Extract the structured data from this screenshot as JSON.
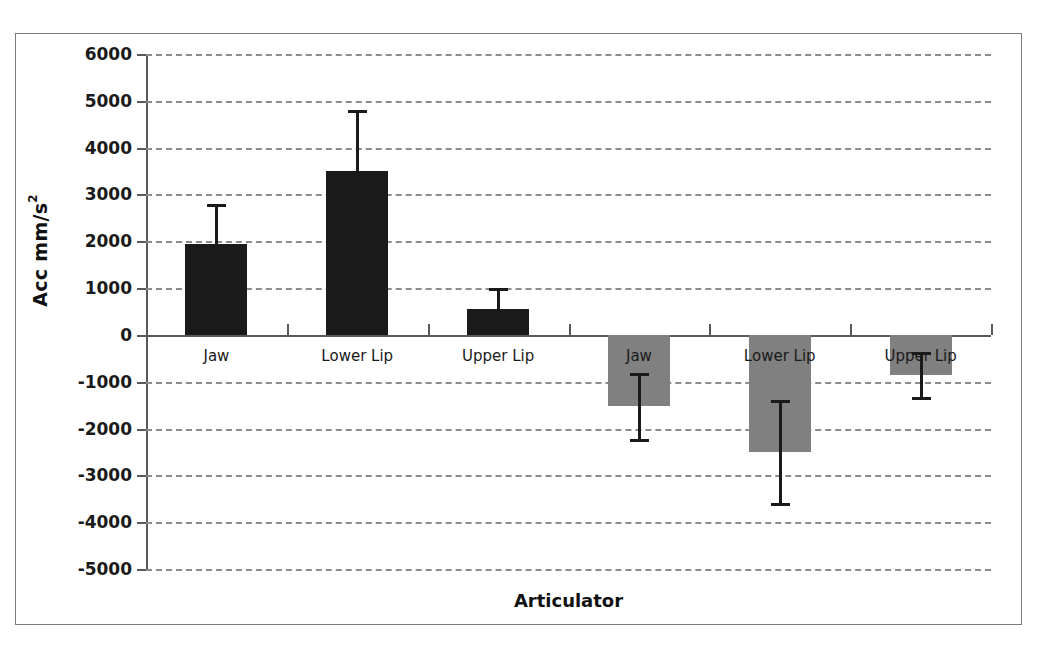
{
  "chart_data": {
    "type": "bar",
    "title": "",
    "subtitle": "",
    "xlabel": "Articulator",
    "ylabel": "Acc mm/s",
    "ylabel_superscript": "2",
    "ylim": [
      -5000,
      6000
    ],
    "ytick_step": 1000,
    "yticks": [
      6000,
      5000,
      4000,
      3000,
      2000,
      1000,
      0,
      -1000,
      -2000,
      -3000,
      -4000,
      -5000
    ],
    "ytick_labels": [
      "6000",
      "5000",
      "4000",
      "3000",
      "2000",
      "1000",
      "0",
      "-1000",
      "-2000",
      "-3000",
      "-4000",
      "-5000"
    ],
    "grid": true,
    "grid_style": "dashed",
    "legend": "none",
    "categories": [
      "Jaw",
      "Lower Lip",
      "Upper Lip",
      "Jaw",
      "Lower Lip",
      "Upper Lip"
    ],
    "bars": [
      {
        "label": "Jaw",
        "value": 1950,
        "error": 850,
        "error_high": 2800,
        "error_low": 1100,
        "color": "#1a1a1a",
        "group": "opening"
      },
      {
        "label": "Lower Lip",
        "value": 3500,
        "error": 1300,
        "error_high": 4800,
        "error_low": 2200,
        "color": "#1a1a1a",
        "group": "opening"
      },
      {
        "label": "Upper Lip",
        "value": 560,
        "error": 440,
        "error_high": 1000,
        "error_low": 120,
        "color": "#1a1a1a",
        "group": "opening"
      },
      {
        "label": "Jaw",
        "value": -1520,
        "error": 700,
        "error_high": -820,
        "error_low": -2220,
        "color": "#808080",
        "group": "closing"
      },
      {
        "label": "Lower Lip",
        "value": -2500,
        "error": 1100,
        "error_high": -1400,
        "error_low": -3600,
        "color": "#808080",
        "group": "closing"
      },
      {
        "label": "Upper Lip",
        "value": -850,
        "error": 480,
        "error_high": -370,
        "error_low": -1330,
        "color": "#808080",
        "group": "closing"
      }
    ],
    "colors": {
      "positive_bar": "#1a1a1a",
      "negative_bar": "#808080",
      "gridline": "#8c8c8c",
      "axis": "#595959",
      "frame": "#7c7c7c",
      "text": "#1a1a1a",
      "background": "#ffffff"
    }
  }
}
